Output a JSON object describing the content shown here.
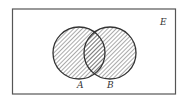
{
  "diagram": {
    "type": "venn",
    "universe_label": "E",
    "sets": [
      {
        "label": "A",
        "shaded": true
      },
      {
        "label": "B",
        "shaded": true
      }
    ],
    "shaded_region": "A ∪ B",
    "colors": {
      "stroke": "#333333",
      "hatch": "#555555",
      "background": "#ffffff"
    }
  }
}
